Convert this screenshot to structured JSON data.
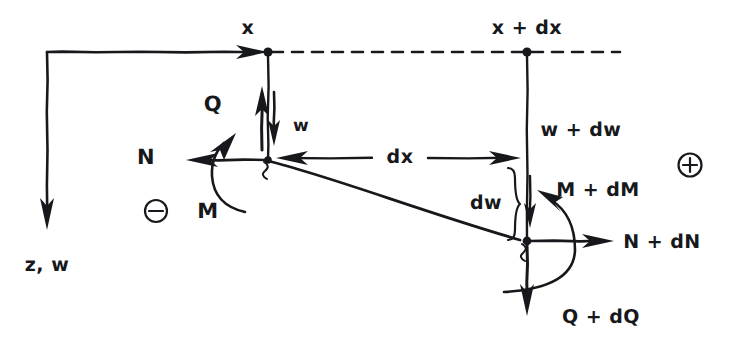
{
  "diagram": {
    "labels": {
      "x_station": "x",
      "x_plus_dx_station": "x + dx",
      "shear_left": "Q",
      "deflection_left": "w",
      "normal_left": "N",
      "moment_left": "M",
      "axis_down": "z, w",
      "span": "dx",
      "deflection_right": "w + dw",
      "deflection_increment": "dw",
      "moment_right": "M + dM",
      "normal_right": "N + dN",
      "shear_right": "Q + dQ",
      "sign_positive": "⊕",
      "sign_negative": "⊖"
    },
    "colors": {
      "ink": "#16181c",
      "paper": "#ffffff"
    },
    "geometry": {
      "left_node": [
        268,
        160
      ],
      "right_node": [
        527,
        241
      ],
      "top_left_station": [
        268,
        52
      ],
      "top_right_station": [
        527,
        52
      ],
      "axis_origin": [
        47,
        52
      ],
      "axis_z_end": [
        47,
        228
      ]
    }
  }
}
